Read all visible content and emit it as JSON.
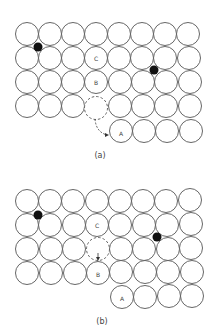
{
  "panels": [
    {
      "caption": "(a)",
      "labels": {
        "A": "A",
        "B": "B",
        "C": "C"
      },
      "description": "Atom lattice with vacancy (dashed) and atom A jumping from vacancy site to surface position; two interstitial atoms (black)"
    },
    {
      "caption": "(b)",
      "labels": {
        "A": "A",
        "B": "B",
        "C": "C"
      },
      "description": "Vacancy moved to position above B; atom B moved down into previous vacancy"
    }
  ],
  "colors": {
    "atom_stroke": "#555555",
    "interstitial": "#111111",
    "background": "#ffffff"
  }
}
